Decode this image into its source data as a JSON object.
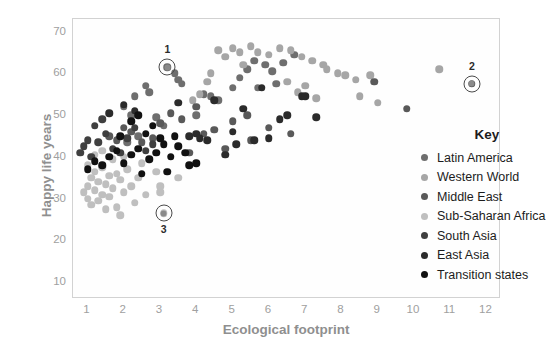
{
  "chart_data": {
    "type": "scatter",
    "title": "",
    "xlabel": "Ecological footprint",
    "ylabel": "Happy life years",
    "xlim": [
      0.6,
      12.4
    ],
    "ylim": [
      6,
      73
    ],
    "xticks": [
      1,
      2,
      3,
      4,
      5,
      6,
      7,
      8,
      9,
      10,
      11,
      12
    ],
    "yticks": [
      10,
      20,
      30,
      40,
      50,
      60,
      70
    ],
    "grid": false,
    "legend_title": "Key",
    "legend_position": "inside-right",
    "series": [
      {
        "name": "Latin America",
        "color": "#6e6e6e",
        "points": [
          [
            2.0,
            52.0
          ],
          [
            2.2,
            50.0
          ],
          [
            2.3,
            54.5
          ],
          [
            2.6,
            57.0
          ],
          [
            2.7,
            55.5
          ],
          [
            3.2,
            61.5
          ],
          [
            3.4,
            60.0
          ],
          [
            3.5,
            58.5
          ],
          [
            3.6,
            57.5
          ],
          [
            2.9,
            49.5
          ],
          [
            3.1,
            47.5
          ],
          [
            4.2,
            55.0
          ],
          [
            4.4,
            54.5
          ],
          [
            4.6,
            53.5
          ],
          [
            5.0,
            56.5
          ],
          [
            5.2,
            59.0
          ],
          [
            5.4,
            61.0
          ],
          [
            5.6,
            63.0
          ],
          [
            5.9,
            62.0
          ],
          [
            6.1,
            60.5
          ],
          [
            6.4,
            62.5
          ],
          [
            6.7,
            64.5
          ],
          [
            4.0,
            50.0
          ],
          [
            2.4,
            45.0
          ],
          [
            2.1,
            43.5
          ],
          [
            5.7,
            56.5
          ],
          [
            6.2,
            57.5
          ]
        ]
      },
      {
        "name": "Western World",
        "color": "#a6a6a6",
        "points": [
          [
            4.6,
            65.5
          ],
          [
            4.8,
            64.0
          ],
          [
            5.0,
            66.0
          ],
          [
            5.2,
            65.0
          ],
          [
            5.5,
            66.5
          ],
          [
            5.7,
            65.0
          ],
          [
            6.0,
            64.5
          ],
          [
            6.3,
            66.0
          ],
          [
            6.6,
            65.5
          ],
          [
            6.9,
            64.0
          ],
          [
            7.2,
            63.0
          ],
          [
            7.5,
            62.0
          ],
          [
            7.6,
            61.0
          ],
          [
            7.9,
            60.0
          ],
          [
            8.1,
            59.5
          ],
          [
            8.4,
            58.5
          ],
          [
            6.5,
            58.0
          ],
          [
            7.0,
            57.0
          ],
          [
            8.8,
            59.5
          ],
          [
            10.7,
            61.0
          ],
          [
            5.3,
            62.0
          ],
          [
            4.4,
            60.0
          ],
          [
            4.3,
            58.0
          ],
          [
            4.1,
            55.0
          ],
          [
            3.9,
            53.5
          ],
          [
            6.8,
            55.5
          ],
          [
            7.3,
            54.0
          ],
          [
            8.5,
            54.5
          ],
          [
            9.0,
            53.0
          ]
        ]
      },
      {
        "name": "Middle East",
        "color": "#595959",
        "points": [
          [
            1.6,
            45.0
          ],
          [
            1.8,
            44.0
          ],
          [
            2.0,
            47.0
          ],
          [
            2.2,
            46.0
          ],
          [
            2.5,
            43.5
          ],
          [
            2.8,
            44.5
          ],
          [
            3.0,
            48.0
          ],
          [
            3.3,
            50.5
          ],
          [
            3.6,
            49.0
          ],
          [
            4.0,
            52.0
          ],
          [
            4.2,
            45.5
          ],
          [
            4.5,
            46.5
          ],
          [
            5.0,
            48.5
          ],
          [
            5.4,
            50.0
          ],
          [
            6.0,
            47.0
          ],
          [
            6.6,
            45.5
          ],
          [
            8.9,
            58.0
          ],
          [
            9.8,
            51.5
          ],
          [
            11.6,
            57.5
          ],
          [
            5.5,
            44.0
          ],
          [
            4.8,
            42.0
          ],
          [
            3.8,
            41.0
          ]
        ]
      },
      {
        "name": "Sub-Saharan Africa",
        "color": "#bfbfbf",
        "points": [
          [
            0.9,
            31.5
          ],
          [
            1.0,
            30.0
          ],
          [
            1.0,
            33.0
          ],
          [
            1.1,
            28.5
          ],
          [
            1.1,
            35.0
          ],
          [
            1.2,
            32.0
          ],
          [
            1.2,
            36.5
          ],
          [
            1.3,
            29.5
          ],
          [
            1.3,
            34.0
          ],
          [
            1.4,
            31.0
          ],
          [
            1.4,
            37.5
          ],
          [
            1.5,
            33.5
          ],
          [
            1.5,
            27.5
          ],
          [
            1.6,
            35.5
          ],
          [
            1.6,
            30.5
          ],
          [
            1.7,
            32.5
          ],
          [
            1.8,
            36.0
          ],
          [
            1.8,
            28.0
          ],
          [
            1.9,
            34.5
          ],
          [
            2.0,
            31.5
          ],
          [
            2.1,
            37.0
          ],
          [
            2.2,
            33.0
          ],
          [
            2.3,
            29.0
          ],
          [
            2.4,
            35.0
          ],
          [
            2.6,
            31.0
          ],
          [
            1.2,
            40.5
          ],
          [
            1.4,
            41.5
          ],
          [
            1.7,
            39.5
          ],
          [
            2.0,
            40.0
          ],
          [
            2.5,
            38.5
          ],
          [
            2.9,
            36.5
          ],
          [
            3.1,
            26.5
          ],
          [
            3.0,
            31.5
          ],
          [
            3.0,
            33.0
          ],
          [
            3.5,
            35.0
          ],
          [
            1.0,
            38.0
          ],
          [
            1.9,
            26.0
          ]
        ]
      },
      {
        "name": "South Asia",
        "color": "#3f3f3f",
        "points": [
          [
            0.8,
            41.0
          ],
          [
            0.9,
            42.5
          ],
          [
            1.0,
            44.0
          ],
          [
            1.1,
            40.0
          ],
          [
            1.3,
            43.5
          ],
          [
            1.5,
            45.5
          ],
          [
            1.7,
            42.0
          ],
          [
            1.9,
            41.0
          ],
          [
            2.1,
            44.5
          ],
          [
            2.3,
            47.0
          ],
          [
            1.2,
            47.5
          ],
          [
            1.4,
            49.0
          ],
          [
            2.6,
            41.5
          ],
          [
            2.8,
            43.0
          ]
        ]
      },
      {
        "name": "East Asia",
        "color": "#2b2b2b",
        "points": [
          [
            1.6,
            50.5
          ],
          [
            2.0,
            52.5
          ],
          [
            2.3,
            51.0
          ],
          [
            3.5,
            53.0
          ],
          [
            3.8,
            45.0
          ],
          [
            4.0,
            45.5
          ],
          [
            4.1,
            44.5
          ],
          [
            4.3,
            44.0
          ],
          [
            4.5,
            53.5
          ],
          [
            5.0,
            46.0
          ],
          [
            5.3,
            51.5
          ],
          [
            5.8,
            56.5
          ],
          [
            6.9,
            54.5
          ],
          [
            7.0,
            54.5
          ],
          [
            4.8,
            40.5
          ],
          [
            5.1,
            43.0
          ],
          [
            5.6,
            44.0
          ],
          [
            6.0,
            44.5
          ],
          [
            6.3,
            49.0
          ],
          [
            6.5,
            50.0
          ],
          [
            7.3,
            49.5
          ]
        ]
      },
      {
        "name": "Transition states",
        "color": "#111111",
        "points": [
          [
            1.0,
            37.0
          ],
          [
            1.2,
            39.0
          ],
          [
            1.4,
            38.0
          ],
          [
            1.6,
            40.0
          ],
          [
            1.8,
            41.5
          ],
          [
            2.0,
            38.5
          ],
          [
            2.2,
            40.5
          ],
          [
            2.4,
            42.0
          ],
          [
            2.5,
            36.0
          ],
          [
            2.7,
            39.5
          ],
          [
            2.9,
            41.0
          ],
          [
            3.1,
            43.0
          ],
          [
            3.3,
            40.0
          ],
          [
            3.5,
            42.5
          ],
          [
            3.7,
            41.0
          ],
          [
            2.6,
            45.5
          ],
          [
            2.8,
            47.5
          ],
          [
            3.0,
            44.5
          ],
          [
            3.4,
            45.0
          ],
          [
            3.8,
            38.0
          ],
          [
            4.0,
            38.5
          ],
          [
            1.9,
            45.0
          ],
          [
            2.2,
            48.5
          ],
          [
            2.4,
            50.0
          ],
          [
            3.2,
            36.5
          ]
        ]
      }
    ],
    "annotations": [
      {
        "label": "1",
        "x": 3.2,
        "y": 61.5,
        "label_position": "above",
        "marker_color": "#8a8a8a"
      },
      {
        "label": "2",
        "x": 11.6,
        "y": 57.5,
        "label_position": "above",
        "marker_color": "#8a8a8a"
      },
      {
        "label": "3",
        "x": 3.1,
        "y": 26.5,
        "label_position": "below",
        "marker_color": "#8a8a8a"
      }
    ]
  },
  "axis": {
    "xlabel": "Ecological footprint",
    "ylabel": "Happy life years"
  },
  "legend": {
    "title": "Key",
    "items": [
      {
        "label": "Latin America",
        "color": "#6e6e6e"
      },
      {
        "label": "Western World",
        "color": "#a6a6a6"
      },
      {
        "label": "Middle East",
        "color": "#595959"
      },
      {
        "label": "Sub-Saharan Africa",
        "color": "#bfbfbf"
      },
      {
        "label": "South Asia",
        "color": "#3f3f3f"
      },
      {
        "label": "East Asia",
        "color": "#2b2b2b"
      },
      {
        "label": "Transition states",
        "color": "#111111"
      }
    ]
  },
  "colors": {
    "axis_text": "#a0a0a0",
    "axis_title": "#8f8f8f",
    "frame": "#d2d2d2",
    "plot_background": "#fefefe",
    "annotation": "#2b2b2b"
  }
}
